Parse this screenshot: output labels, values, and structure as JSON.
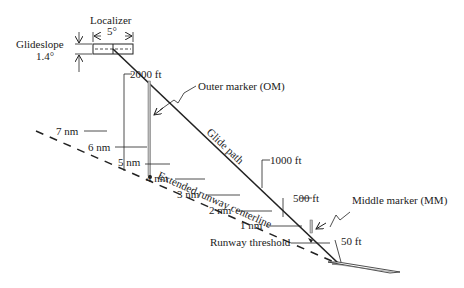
{
  "localizer": {
    "label": "Localizer",
    "angle": "5°"
  },
  "glideslope": {
    "label": "Glideslope",
    "angle": "1.4°"
  },
  "glide_path_label": "Glide path",
  "centerline_label": "Extended runway centerline",
  "outer_marker_label": "Outer marker (OM)",
  "middle_marker_label": "Middle marker (MM)",
  "runway_threshold_label": "Runway threshold",
  "altitudes": [
    "2000 ft",
    "1000 ft",
    "500 ft",
    "50 ft"
  ],
  "distances": [
    "7 nm",
    "6 nm",
    "5 nm",
    "4 nm",
    "3 nm",
    "2 nm",
    "1 nm"
  ],
  "colors": {
    "line": "#222222",
    "marker": "#888888"
  }
}
